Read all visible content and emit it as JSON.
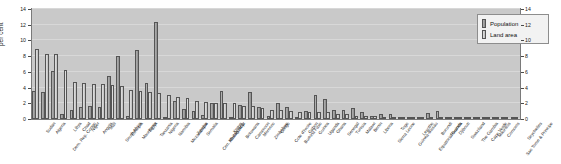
{
  "chart_data": {
    "type": "bar",
    "title": "",
    "xlabel": "",
    "ylabel": "per cent",
    "ylim": [
      0,
      14
    ],
    "yticks": [
      0,
      2,
      4,
      6,
      8,
      10,
      12,
      14
    ],
    "right_axis": true,
    "right_yticks": [
      0,
      2,
      4,
      6,
      8,
      10,
      12,
      14
    ],
    "grid": true,
    "legend_position": "top-right",
    "categories": [
      "Sudan",
      "Algeria",
      "Dem. Rep. Congo",
      "Libya",
      "Chad",
      "Niger",
      "Angola",
      "Mali",
      "South Africa",
      "Ethiopia",
      "Mauritania",
      "Egypt",
      "Tanzania",
      "Nigeria",
      "Namibia",
      "Mozambique",
      "Zambia",
      "Somalia",
      "Cen. African Rep.",
      "Madagascar",
      "Kenya",
      "Botswana",
      "Cameroon",
      "Morocco",
      "Zimbabwe",
      "Congo",
      "Cote d'Ivoire",
      "Burkina Faso",
      "Gabon",
      "Guinea",
      "Uganda",
      "Ghana",
      "Senegal",
      "Tunisia",
      "Malawi",
      "Benin",
      "Liberia",
      "Sierra Leone",
      "Togo",
      "Guinea-Bissau",
      "Lesotho",
      "Equatorial Guinea",
      "Burundi",
      "Rwanda",
      "Djibouti",
      "Swaziland",
      "The Gambia",
      "Cape Verde",
      "Mauritius",
      "Comoros",
      "Sao Tome & Principe",
      "Seychelles"
    ],
    "series": [
      {
        "name": "Population",
        "color": "#9a9a9a",
        "values": [
          3.6,
          3.4,
          6.1,
          0.7,
          1.1,
          1.5,
          1.6,
          1.5,
          5.5,
          8.0,
          0.4,
          8.8,
          4.6,
          12.4,
          0.2,
          2.3,
          1.3,
          1.0,
          0.5,
          2.0,
          3.6,
          0.2,
          1.8,
          3.5,
          1.5,
          0.4,
          2.0,
          1.5,
          0.2,
          1.0,
          3.1,
          2.5,
          1.2,
          1.2,
          1.4,
          0.9,
          0.4,
          0.6,
          0.7,
          0.2,
          0.2,
          0.1,
          0.8,
          1.0,
          0.1,
          0.1,
          0.2,
          0.1,
          0.1,
          0.1,
          0.0,
          0.0
        ]
      },
      {
        "name": "Land area",
        "color": "#cfcfcf",
        "values": [
          8.9,
          8.3,
          8.3,
          6.3,
          4.7,
          4.6,
          4.5,
          4.5,
          4.3,
          4.2,
          3.7,
          3.6,
          3.4,
          3.3,
          3.0,
          2.8,
          2.7,
          2.3,
          2.2,
          2.1,
          2.0,
          2.0,
          1.7,
          1.6,
          1.4,
          1.2,
          1.2,
          1.0,
          0.9,
          0.9,
          0.9,
          0.9,
          0.7,
          0.6,
          0.4,
          0.4,
          0.4,
          0.3,
          0.2,
          0.2,
          0.2,
          0.2,
          0.1,
          0.1,
          0.1,
          0.1,
          0.1,
          0.0,
          0.0,
          0.0,
          0.0,
          0.0
        ]
      }
    ]
  },
  "axis": {
    "ylabel": "per cent",
    "left_ticks": [
      "0",
      "2",
      "4",
      "6",
      "8",
      "10",
      "12",
      "14"
    ],
    "right_ticks": [
      "0",
      "2",
      "4",
      "6",
      "8",
      "10",
      "12",
      "14"
    ]
  },
  "legend": {
    "items": [
      {
        "label": "Population",
        "swatch": "pop"
      },
      {
        "label": "Land area",
        "swatch": "land"
      }
    ]
  }
}
